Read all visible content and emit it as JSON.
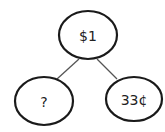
{
  "diagram": {
    "type": "number-bond",
    "nodes": {
      "whole": {
        "label": "$1"
      },
      "part_left": {
        "label": "?"
      },
      "part_right": {
        "label": "33¢"
      }
    },
    "edges": [
      {
        "from": "whole",
        "to": "part_left"
      },
      {
        "from": "whole",
        "to": "part_right"
      }
    ],
    "colors": {
      "stroke": "#1a1a1a",
      "line": "#555555",
      "background": "#ffffff"
    }
  }
}
